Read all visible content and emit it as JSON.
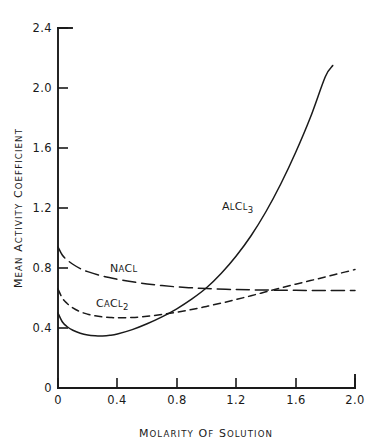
{
  "chart_data": {
    "type": "line",
    "title": "",
    "xlabel": "MOLARITY OF SOLUTION",
    "ylabel": "MEAN ACTIVITY COEFFICIENT",
    "xlim": [
      0,
      2.0
    ],
    "ylim": [
      0,
      2.4
    ],
    "xticks": [
      "0",
      "0.4",
      "0.8",
      "1.2",
      "1.6",
      "2.0"
    ],
    "xtick_values": [
      0,
      0.4,
      0.8,
      1.2,
      1.6,
      2.0
    ],
    "yticks": [
      "0",
      "0.4",
      "0.8",
      "1.2",
      "1.6",
      "2.0",
      "2.4"
    ],
    "ytick_values": [
      0,
      0.4,
      0.8,
      1.2,
      1.6,
      2.0,
      2.4
    ],
    "grid": false,
    "legend_position": "inline-annotations",
    "series": [
      {
        "name": "AlCl3",
        "label_main": "A",
        "label_parts": [
          "A",
          "L",
          "C",
          "L",
          "3"
        ],
        "style": "solid",
        "annotation": {
          "text": "AlCl3",
          "x": 1.05,
          "y": 1.22
        },
        "x": [
          0.0,
          0.03,
          0.06,
          0.1,
          0.15,
          0.2,
          0.25,
          0.3,
          0.35,
          0.4,
          0.5,
          0.6,
          0.7,
          0.8,
          0.9,
          1.0,
          1.1,
          1.2,
          1.3,
          1.4,
          1.5,
          1.6,
          1.7,
          1.8,
          1.85
        ],
        "y": [
          0.5,
          0.44,
          0.41,
          0.385,
          0.365,
          0.353,
          0.348,
          0.347,
          0.351,
          0.36,
          0.389,
          0.428,
          0.474,
          0.528,
          0.592,
          0.668,
          0.765,
          0.88,
          1.015,
          1.175,
          1.36,
          1.57,
          1.805,
          2.075,
          2.15
        ]
      },
      {
        "name": "NaCl",
        "label_parts": [
          "N",
          "A",
          "C",
          "L"
        ],
        "style": "long-dash",
        "annotation": {
          "text": "NaCl",
          "x": 0.39,
          "y": 0.735
        },
        "x": [
          0.0,
          0.03,
          0.06,
          0.1,
          0.15,
          0.2,
          0.3,
          0.4,
          0.5,
          0.6,
          0.7,
          0.8,
          0.9,
          1.0,
          1.2,
          1.4,
          1.6,
          1.8,
          2.0
        ],
        "y": [
          0.94,
          0.885,
          0.855,
          0.825,
          0.796,
          0.776,
          0.746,
          0.725,
          0.708,
          0.694,
          0.683,
          0.674,
          0.668,
          0.663,
          0.656,
          0.653,
          0.651,
          0.65,
          0.65
        ]
      },
      {
        "name": "CaCl2",
        "label_parts": [
          "C",
          "A",
          "C",
          "L",
          "2"
        ],
        "style": "short-dash",
        "annotation": {
          "text": "CaCl2",
          "x": 0.33,
          "y": 0.565
        },
        "x": [
          0.0,
          0.03,
          0.06,
          0.1,
          0.15,
          0.2,
          0.25,
          0.3,
          0.35,
          0.4,
          0.5,
          0.6,
          0.7,
          0.8,
          0.9,
          1.0,
          1.1,
          1.2,
          1.3,
          1.4,
          1.5,
          1.6,
          1.7,
          1.8,
          1.9,
          2.0
        ],
        "y": [
          0.66,
          0.598,
          0.565,
          0.534,
          0.508,
          0.492,
          0.481,
          0.474,
          0.47,
          0.468,
          0.47,
          0.478,
          0.49,
          0.505,
          0.523,
          0.544,
          0.566,
          0.59,
          0.615,
          0.641,
          0.667,
          0.692,
          0.716,
          0.74,
          0.765,
          0.79
        ]
      }
    ]
  }
}
